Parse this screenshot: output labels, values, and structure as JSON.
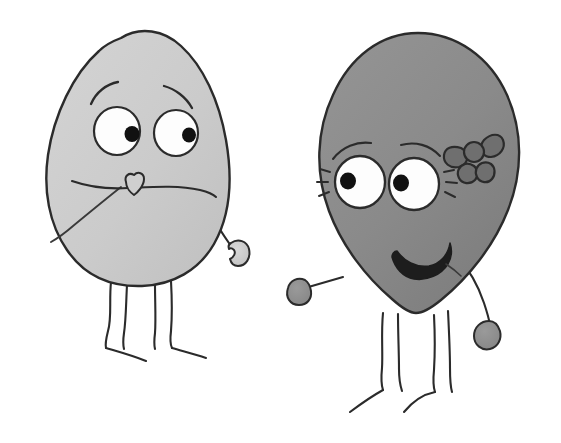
{
  "scene": {
    "title": "Two hand-drawn cartoon blob characters",
    "width": 561,
    "height": 443,
    "background_color": "#ffffff",
    "style": "hand-drawn marker illustration, grayscale",
    "stroke_color": "#2b2b2b",
    "caption": ""
  },
  "palette": {
    "background": "#ffffff",
    "ink": "#2b2b2b",
    "ink_soft": "#3a3a3a",
    "left_body_fill": "#cdcdcd",
    "left_body_fill_shade": "#c2c2c2",
    "left_hand_fill": "#c9c9c9",
    "right_body_fill": "#8a8a8a",
    "right_body_fill_shade": "#7e7e7e",
    "right_hand_fill": "#8f8f8f",
    "bow_fill": "#6f6f6f",
    "eye_white": "#fdfdfd",
    "pupil": "#111111"
  },
  "characters": [
    {
      "id": "left-character",
      "name": "light-gray-egg-character",
      "label": "Worried light gray egg-shaped character",
      "body_shape": "egg",
      "body_color": "#cdcdcd",
      "expression": "worried",
      "mouth": "wavy-flat-frown",
      "nose": "small-heart-nose",
      "eyes": {
        "count": 2,
        "pupil_direction": "right",
        "has_lashes": false
      },
      "eyebrows": "raised-worried",
      "arms": 1,
      "hands": 1,
      "legs": 2,
      "accessories": []
    },
    {
      "id": "right-character",
      "name": "dark-gray-balloon-character",
      "label": "Smiling medium gray balloon-shaped character with bow",
      "body_shape": "balloon",
      "body_color": "#8a8a8a",
      "expression": "happy",
      "mouth": "wide-smile",
      "nose": "none",
      "eyes": {
        "count": 2,
        "pupil_direction": "left",
        "has_lashes": true
      },
      "eyebrows": "thin-arched",
      "arms": 2,
      "hands": 2,
      "legs": 2,
      "accessories": [
        "hair-bow"
      ]
    }
  ]
}
